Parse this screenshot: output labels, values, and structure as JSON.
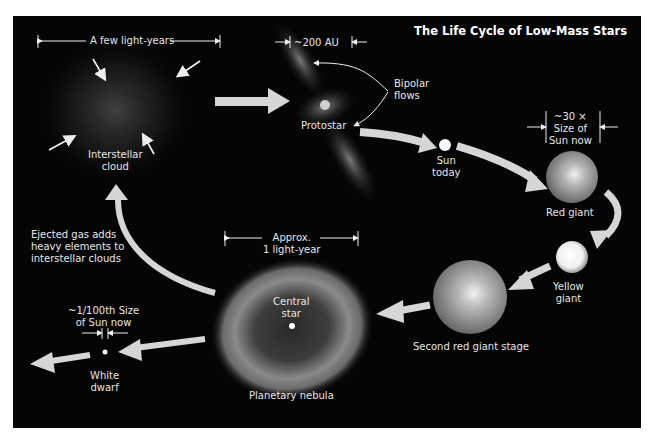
{
  "title": "The Life Cycle of Low-Mass Stars",
  "stages": {
    "interstellar_cloud": {
      "label_1": "Interstellar",
      "label_2": "cloud",
      "scale": "A few light-years"
    },
    "protostar": {
      "label": "Protostar",
      "scale": "~200 AU",
      "flows_1": "Bipolar",
      "flows_2": "flows"
    },
    "sun_today": {
      "label_1": "Sun",
      "label_2": "today"
    },
    "red_giant": {
      "label": "Red giant",
      "scale_1": "~30 ×",
      "scale_2": "Size of",
      "scale_3": "Sun now"
    },
    "yellow_giant": {
      "label_1": "Yellow",
      "label_2": "giant"
    },
    "second_red_giant": {
      "label": "Second red giant stage"
    },
    "planetary_nebula": {
      "label": "Planetary nebula",
      "central_1": "Central",
      "central_2": "star",
      "scale_1": "Approx.",
      "scale_2": "1 light-year"
    },
    "white_dwarf": {
      "label_1": "White",
      "label_2": "dwarf",
      "scale_1": "~1/100th Size",
      "scale_2": "of Sun now"
    }
  },
  "recycle_note": {
    "line_1": "Ejected gas adds",
    "line_2": "heavy elements to",
    "line_3": "interstellar clouds"
  },
  "colors": {
    "background": "#050505",
    "arrow": "#d6d6d6",
    "text": "#e6e6e6"
  }
}
